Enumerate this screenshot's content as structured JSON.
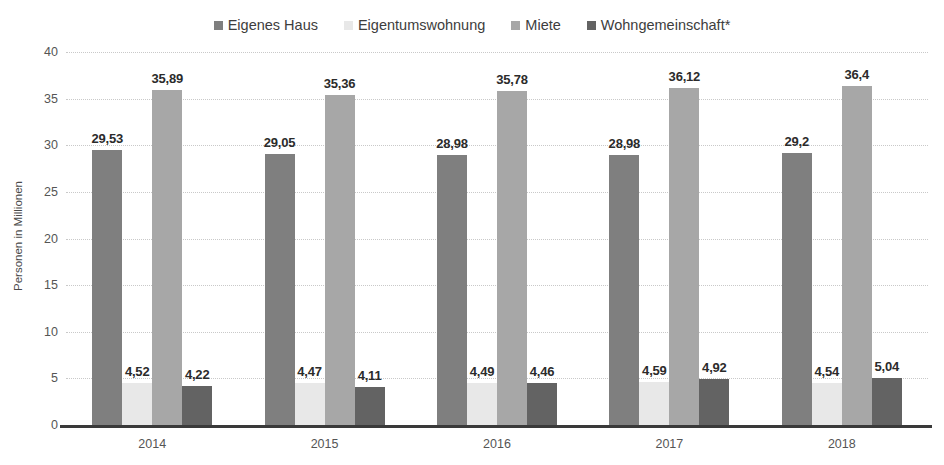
{
  "chart_data": {
    "type": "bar",
    "title": "",
    "subtitle": "",
    "xlabel": "",
    "ylabel": "Personen in Millionen",
    "categories": [
      "2014",
      "2015",
      "2016",
      "2017",
      "2018"
    ],
    "ylim": [
      0,
      40
    ],
    "yticks": [
      0,
      5,
      10,
      15,
      20,
      25,
      30,
      35,
      40
    ],
    "ytick_labels": [
      "0",
      "5",
      "10",
      "15",
      "20",
      "25",
      "30",
      "35",
      "40"
    ],
    "grid": true,
    "legend_position": "top-center",
    "series": [
      {
        "name": "Eigenes Haus",
        "color": "#7f7f7f",
        "values": [
          29.53,
          29.05,
          28.98,
          28.98,
          29.2
        ],
        "labels": [
          "29,53",
          "29,05",
          "28,98",
          "28,98",
          "29,2"
        ]
      },
      {
        "name": "Eigentumswohnung",
        "color": "#e8e8e8",
        "values": [
          4.52,
          4.47,
          4.49,
          4.59,
          4.54
        ],
        "labels": [
          "4,52",
          "4,47",
          "4,49",
          "4,59",
          "4,54"
        ]
      },
      {
        "name": "Miete",
        "color": "#a7a7a7",
        "values": [
          35.89,
          35.36,
          35.78,
          36.12,
          36.4
        ],
        "labels": [
          "35,89",
          "35,36",
          "35,78",
          "36,12",
          "36,4"
        ]
      },
      {
        "name": "Wohngemeinschaft*",
        "color": "#636363",
        "values": [
          4.22,
          4.11,
          4.46,
          4.92,
          5.04
        ],
        "labels": [
          "4,22",
          "4,11",
          "4,46",
          "4,92",
          "5,04"
        ]
      }
    ]
  }
}
